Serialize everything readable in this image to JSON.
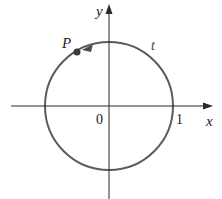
{
  "diagram": {
    "type": "unit-circle",
    "axes": {
      "x_label": "x",
      "y_label": "y",
      "origin_label": "0",
      "tick_label": "1"
    },
    "point": {
      "label": "P"
    },
    "arc": {
      "label": "t"
    },
    "colors": {
      "axis": "#2a2a2a",
      "circle": "#5c5c5c",
      "point": "#3a3a3a",
      "text": "#222222"
    }
  }
}
